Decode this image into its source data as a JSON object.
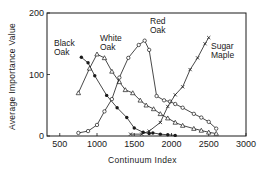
{
  "chart_data": {
    "type": "line",
    "title": "",
    "xlabel": "Continuum Index",
    "ylabel": "Average Importance Value",
    "xlim": [
      340,
      3000
    ],
    "ylim": [
      0,
      200
    ],
    "xticks": [
      500,
      1000,
      1500,
      2000,
      2500,
      3000
    ],
    "yticks": [
      0,
      100,
      200
    ],
    "grid": false,
    "legend_position": "inline labels",
    "series": [
      {
        "name": "Black Oak",
        "marker": "filled-circle",
        "label_lines": [
          "Black",
          "Oak"
        ],
        "x": [
          790,
          880,
          970,
          1130,
          1270,
          1400,
          1500,
          1620,
          1700,
          1750,
          1850,
          1950,
          2050
        ],
        "y": [
          128,
          119,
          98,
          66,
          46,
          30,
          13,
          6,
          4,
          5,
          3,
          2,
          1
        ]
      },
      {
        "name": "White Oak",
        "marker": "open-triangle",
        "label_lines": [
          "White",
          "Oak"
        ],
        "x": [
          750,
          900,
          1000,
          1100,
          1200,
          1300,
          1380,
          1480,
          1580,
          1660,
          1760,
          1850,
          1950,
          2050,
          2150,
          2300,
          2400,
          2500,
          2600
        ],
        "y": [
          70,
          110,
          133,
          127,
          105,
          88,
          75,
          70,
          58,
          50,
          44,
          36,
          29,
          22,
          17,
          12,
          9,
          6,
          4
        ]
      },
      {
        "name": "Red Oak",
        "marker": "open-circle",
        "label_lines": [
          "Red",
          "Oak"
        ],
        "x": [
          750,
          880,
          1000,
          1100,
          1200,
          1300,
          1420,
          1560,
          1640,
          1700,
          1800,
          1900,
          1980,
          2050,
          2150,
          2300,
          2400,
          2500,
          2600
        ],
        "y": [
          5,
          8,
          18,
          40,
          60,
          95,
          127,
          148,
          155,
          140,
          65,
          58,
          56,
          52,
          46,
          36,
          30,
          23,
          12
        ]
      },
      {
        "name": "Sugar Maple",
        "marker": "x",
        "label_lines": [
          "Sugar",
          "Maple"
        ],
        "x": [
          1450,
          1600,
          1700,
          1850,
          1950,
          2050,
          2150,
          2250,
          2350,
          2450,
          2500
        ],
        "y": [
          3,
          3,
          8,
          22,
          48,
          67,
          80,
          108,
          127,
          150,
          160
        ]
      }
    ]
  }
}
